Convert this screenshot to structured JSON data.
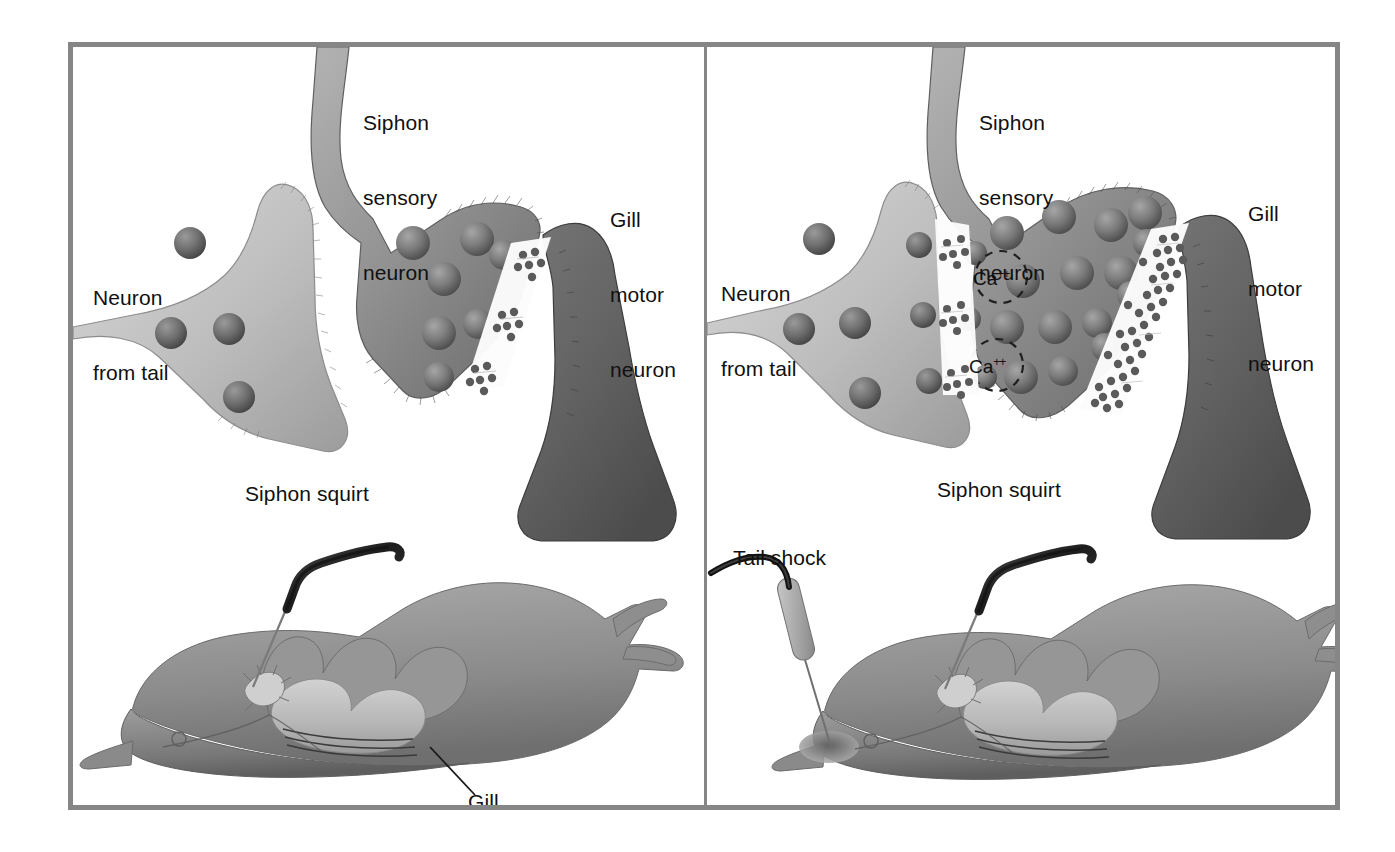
{
  "figure": {
    "frame_color": "#868686",
    "background": "#ffffff",
    "panel_count": 2
  },
  "panels": [
    {
      "id": "before-tail-shock",
      "name": "left-panel",
      "state": "resting / siphon squirt only",
      "labels": {
        "sensory_neuron": "Siphon\nsensory\nneuron",
        "tail_neuron": "Neuron\nfrom tail",
        "motor_neuron": "Gill\nmotor\nneuron",
        "siphon_squirt": "Siphon squirt",
        "gill": "Gill",
        "tail_shock": ""
      },
      "cell_biology": {
        "tail_neuron_vesicles": 4,
        "sensory_neuron_vesicles": 4,
        "tail_to_sensory_release_sites": 0,
        "sensory_to_motor_release_sites": 3,
        "transmitter_particles_in_cleft": 18,
        "calcium_labels": []
      },
      "stimuli": [
        "siphon squirt"
      ]
    },
    {
      "id": "after-tail-shock",
      "name": "right-panel",
      "state": "sensitized / tail shock + siphon squirt",
      "labels": {
        "sensory_neuron": "Siphon\nsensory\nneuron",
        "tail_neuron": "Neuron\nfrom tail",
        "motor_neuron": "Gill\nmotor\nneuron",
        "siphon_squirt": "Siphon squirt",
        "gill": "",
        "tail_shock": "Tail shock"
      },
      "cell_biology": {
        "tail_neuron_vesicles": 5,
        "sensory_neuron_vesicles": 12,
        "tail_to_sensory_release_sites": 3,
        "sensory_to_motor_release_sites": 6,
        "transmitter_particles_in_cleft": 52,
        "calcium_labels": [
          "Ca++",
          "Ca++"
        ]
      },
      "stimuli": [
        "tail shock",
        "siphon squirt"
      ]
    }
  ],
  "ion": {
    "symbol": "Ca",
    "charge": "++"
  },
  "text_lines": {
    "siphon_sensory": [
      "Siphon",
      "sensory",
      "neuron"
    ],
    "neuron_from_tail": [
      "Neuron",
      "from tail"
    ],
    "gill_motor": [
      "Gill",
      "motor",
      "neuron"
    ],
    "siphon_squirt": "Siphon squirt",
    "gill": "Gill",
    "tail_shock": "Tail shock"
  },
  "colors": {
    "frame": "#868686",
    "tail_neuron_light": "#c9c9c9",
    "tail_neuron_mid": "#a8a8a8",
    "sensory_neuron_mid": "#9a9a9a",
    "sensory_neuron_dark": "#6f6f6f",
    "motor_neuron_dark": "#646464",
    "vesicle": "#6e6e6e",
    "transmitter": "#5f5f5f",
    "cleft": "#fbfbfb",
    "body_light": "#b3b3b3",
    "body_mid": "#8e8e8e",
    "body_dark": "#6a6a6a",
    "gill_light": "#c6c6c6",
    "pipette": "#2b2b2b",
    "text": "#101010"
  }
}
